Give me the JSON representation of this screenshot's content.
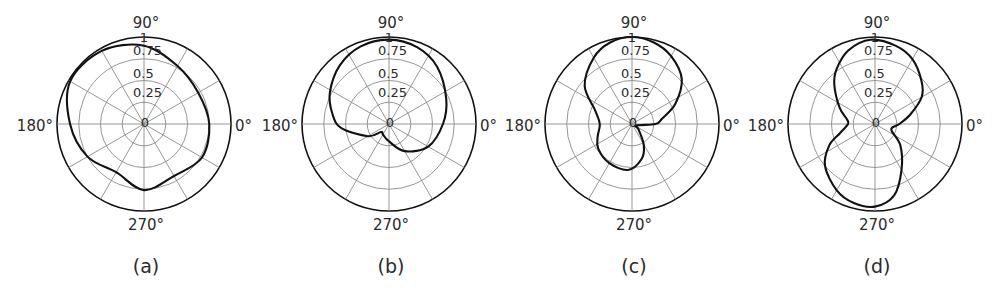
{
  "chart_data": [
    {
      "type": "polar-line",
      "panel_label": "(a)",
      "center": [
        144,
        124
      ],
      "radius": 87,
      "angle_labels": {
        "top": "90°",
        "left": "180°",
        "right": "0°",
        "bottom": "270°"
      },
      "r_tick_labels": [
        "0",
        "0.25",
        "0.5",
        "0.75",
        "1"
      ],
      "rlim": [
        0,
        1
      ],
      "grid": {
        "rings": [
          0.25,
          0.5,
          0.75,
          1.0
        ],
        "spokes_deg": 30
      },
      "theta_deg": [
        0,
        30,
        60,
        90,
        120,
        150,
        180,
        210,
        240,
        270,
        300,
        330
      ],
      "r": [
        0.75,
        0.72,
        0.77,
        0.9,
        0.97,
        0.98,
        0.85,
        0.75,
        0.64,
        0.76,
        0.69,
        0.77
      ]
    },
    {
      "type": "polar-line",
      "panel_label": "(b)",
      "center": [
        389,
        124
      ],
      "radius": 87,
      "angle_labels": {
        "top": "90°",
        "left": "180°",
        "right": "0°",
        "bottom": "270°"
      },
      "r_tick_labels": [
        "0",
        "0.25",
        "0.5",
        "0.75",
        "1"
      ],
      "rlim": [
        0,
        1
      ],
      "grid": {
        "rings": [
          0.25,
          0.5,
          0.75,
          1.0
        ],
        "spokes_deg": 30
      },
      "theta_deg": [
        0,
        24,
        50,
        70,
        90,
        110,
        130,
        152,
        170,
        185,
        210,
        225,
        240,
        270,
        300,
        330
      ],
      "r": [
        0.62,
        0.72,
        0.86,
        0.94,
        0.97,
        0.95,
        0.88,
        0.77,
        0.66,
        0.55,
        0.28,
        0.13,
        0.14,
        0.2,
        0.36,
        0.52
      ]
    },
    {
      "type": "polar-line",
      "panel_label": "(c)",
      "center": [
        632,
        124
      ],
      "radius": 87,
      "angle_labels": {
        "top": "90°",
        "left": "180°",
        "right": "0°",
        "bottom": "270°"
      },
      "r_tick_labels": [
        "0",
        "0.25",
        "0.5",
        "0.75",
        "1"
      ],
      "rlim": [
        0,
        1
      ],
      "grid": {
        "rings": [
          0.25,
          0.5,
          0.75,
          1.0
        ],
        "spokes_deg": 30
      },
      "theta_deg": [
        0,
        10,
        25,
        42,
        60,
        75,
        90,
        105,
        120,
        141,
        160,
        180,
        200,
        216,
        240,
        265,
        285,
        299,
        320,
        340
      ],
      "r": [
        0.27,
        0.35,
        0.55,
        0.77,
        0.9,
        0.97,
        1.0,
        0.97,
        0.88,
        0.7,
        0.45,
        0.37,
        0.42,
        0.48,
        0.52,
        0.53,
        0.42,
        0.28,
        0.1,
        0.05
      ]
    },
    {
      "type": "polar-line",
      "panel_label": "(d)",
      "center": [
        875,
        124
      ],
      "radius": 87,
      "angle_labels": {
        "top": "90°",
        "left": "180°",
        "right": "0°",
        "bottom": "270°"
      },
      "r_tick_labels": [
        "0",
        "0.25",
        "0.5",
        "0.75",
        "1"
      ],
      "rlim": [
        0,
        1
      ],
      "grid": {
        "rings": [
          0.25,
          0.5,
          0.75,
          1.0
        ],
        "spokes_deg": 30
      },
      "theta_deg": [
        0,
        15,
        30,
        43,
        60,
        75,
        93,
        110,
        125,
        136,
        155,
        170,
        180,
        195,
        205,
        220,
        240,
        255,
        270,
        285,
        300,
        320,
        340,
        355
      ],
      "r": [
        0.28,
        0.42,
        0.62,
        0.73,
        0.86,
        0.93,
        0.97,
        0.9,
        0.77,
        0.65,
        0.45,
        0.33,
        0.31,
        0.42,
        0.58,
        0.75,
        0.88,
        0.94,
        0.95,
        0.85,
        0.61,
        0.38,
        0.2,
        0.24
      ]
    }
  ],
  "style": {
    "curve_color": "#111111",
    "grid_color": "#8a8a8a",
    "outer_ring_color": "#111111",
    "background": "#ffffff"
  }
}
